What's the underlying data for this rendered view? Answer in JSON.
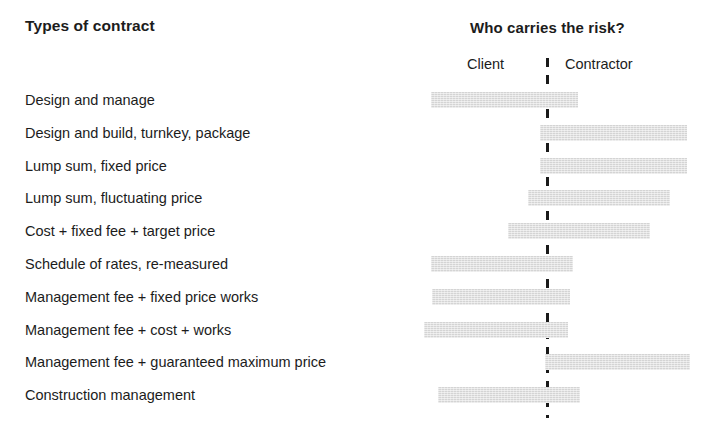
{
  "header": {
    "left_title": "Types of contract",
    "right_title": "Who carries the risk?",
    "axis_left_label": "Client",
    "axis_right_label": "Contractor"
  },
  "chart_data": {
    "type": "bar",
    "title": "Who carries the risk?",
    "xlabel": "",
    "ylabel": "Types of contract",
    "grid": false,
    "legend_position": "none",
    "orientation": "horizontal",
    "axis_scale": {
      "left_end_px": 410,
      "divider_px": 547,
      "right_end_px": 700,
      "note": "Bars are floating spans; left of divider = client risk, right = contractor risk"
    },
    "categories": [
      "Design and manage",
      "Design and build, turnkey, package",
      "Lump sum, fixed price",
      "Lump sum, fluctuating price",
      "Cost + fixed fee + target price",
      "Schedule of rates, re-measured",
      "Management fee + fixed price works",
      "Management fee + cost + works",
      "Management fee + guaranteed maximum price",
      "Construction management"
    ],
    "bars": [
      {
        "label": "Design and manage",
        "start_px": 431,
        "end_px": 578,
        "risk_bias": "client"
      },
      {
        "label": "Design and build, turnkey, package",
        "start_px": 540,
        "end_px": 687,
        "risk_bias": "contractor"
      },
      {
        "label": "Lump sum, fixed price",
        "start_px": 540,
        "end_px": 687,
        "risk_bias": "contractor"
      },
      {
        "label": "Lump sum, fluctuating price",
        "start_px": 528,
        "end_px": 670,
        "risk_bias": "contractor"
      },
      {
        "label": "Cost + fixed fee + target price",
        "start_px": 508,
        "end_px": 650,
        "risk_bias": "mixed"
      },
      {
        "label": "Schedule of rates, re-measured",
        "start_px": 431,
        "end_px": 573,
        "risk_bias": "client"
      },
      {
        "label": "Management fee + fixed price works",
        "start_px": 432,
        "end_px": 570,
        "risk_bias": "client"
      },
      {
        "label": "Management fee + cost + works",
        "start_px": 424,
        "end_px": 568,
        "risk_bias": "client"
      },
      {
        "label": "Management fee + guaranteed maximum price",
        "start_px": 545,
        "end_px": 690,
        "risk_bias": "contractor"
      },
      {
        "label": "Construction management",
        "start_px": 438,
        "end_px": 580,
        "risk_bias": "client"
      }
    ],
    "colors": {
      "bar_fill": "#d4d4d4",
      "divider": "#1a1a1a",
      "text": "#1c1c1c",
      "background": "#ffffff"
    }
  }
}
